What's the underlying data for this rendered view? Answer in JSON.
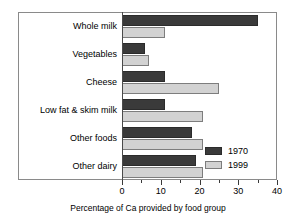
{
  "chart_data": {
    "type": "bar",
    "orientation": "horizontal",
    "title": "",
    "xlabel": "Percentage of Ca provided by food group",
    "ylabel": "",
    "categories": [
      "Whole milk",
      "Vegetables",
      "Cheese",
      "Low fat & skim milk",
      "Other foods",
      "Other dairy"
    ],
    "series": [
      {
        "name": "1970",
        "color": "#3a3a3a",
        "values": [
          35,
          6,
          11,
          11,
          18,
          19
        ]
      },
      {
        "name": "1999",
        "color": "#d2d2d2",
        "values": [
          11,
          7,
          25,
          21,
          21,
          21
        ]
      }
    ],
    "xlim": [
      0,
      40
    ],
    "xticks": [
      0,
      10,
      20,
      30,
      40
    ],
    "xtick_labels": [
      "0",
      "10",
      "20",
      "30",
      "40"
    ],
    "xminor_ticks": [
      5,
      15,
      25,
      35
    ],
    "grid": false,
    "legend_position": "lower right"
  }
}
